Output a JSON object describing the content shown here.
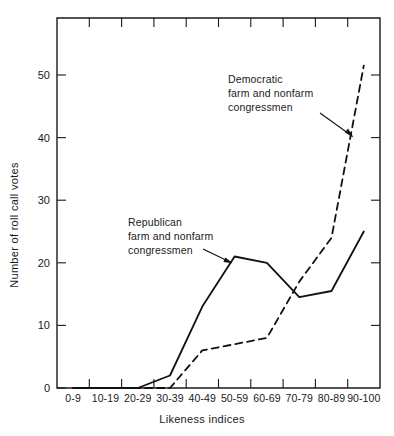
{
  "chart_data": {
    "type": "line",
    "title": "",
    "xlabel": "Likeness indices",
    "ylabel": "Number of roll call votes",
    "categories": [
      "0-9",
      "10-19",
      "20-29",
      "30-39",
      "40-49",
      "50-59",
      "60-69",
      "70-79",
      "80-89",
      "90-100"
    ],
    "xtick_labels": [
      "0-9",
      "10-19",
      "20-29",
      "30-39",
      "40-49",
      "50-59",
      "60-69",
      "70-79",
      "80-89",
      "90-100"
    ],
    "ytick_labels": [
      "0",
      "10",
      "20",
      "30",
      "40",
      "50"
    ],
    "yticks": [
      0,
      10,
      20,
      30,
      40,
      50
    ],
    "ylim": [
      0,
      56
    ],
    "xlim": [
      0,
      10
    ],
    "grid": false,
    "legend_position": "inline-annotations",
    "series": [
      {
        "name": "Republican farm and nonfarm congressmen",
        "style": "solid",
        "color": "#111111",
        "values": [
          0,
          0,
          0,
          2,
          13,
          21,
          20,
          14.5,
          15.5,
          25
        ]
      },
      {
        "name": "Democratic farm and nonfarm congressmen",
        "style": "dashed",
        "color": "#111111",
        "values": [
          0,
          0,
          0,
          0,
          6,
          7,
          8,
          17,
          24,
          51.5
        ]
      }
    ],
    "annotations": [
      {
        "id": "democratic-label",
        "lines": [
          "Democratic",
          "farm and nonfarm",
          "congressmen"
        ],
        "points_to_series": "Democratic farm and nonfarm congressmen"
      },
      {
        "id": "republican-label",
        "lines": [
          "Republican",
          "farm and nonfarm",
          "congressmen"
        ],
        "points_to_series": "Republican farm and nonfarm congressmen"
      }
    ]
  }
}
